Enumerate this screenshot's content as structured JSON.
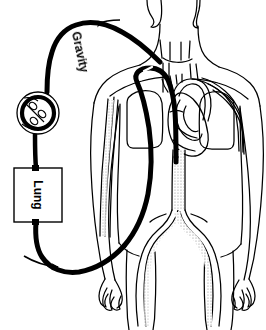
{
  "figure": {
    "domain": "diagram",
    "background_color": "#ffffff",
    "line_color": "#000000",
    "stipple_color": "#9a9a9a",
    "width": 266,
    "height": 330
  },
  "labels": {
    "gravity": "Gravity",
    "lung": "Lung"
  },
  "components": {
    "lung_box": {
      "label": "Lung",
      "x": 14,
      "y": 168,
      "width": 48,
      "height": 54,
      "text_rotation": 90
    },
    "pump": {
      "name": "roller-pump",
      "cx": 38,
      "cy": 113,
      "outer_r": 21,
      "inner_r": 15,
      "roller_count": 3
    },
    "tubing": {
      "color": "#000000",
      "stroke_width": 5,
      "venous_limb_label": "Gravity",
      "arrows": 2
    },
    "cannula": {
      "insertion": "neck / superior vena cava",
      "color": "#000000"
    }
  },
  "arrows": [
    {
      "name": "top-flow-arrow",
      "direction": "left",
      "x": 96,
      "y": 24
    },
    {
      "name": "bottom-flow-arrow",
      "direction": "right",
      "x": 34,
      "y": 262
    }
  ],
  "anatomy": [
    {
      "name": "head-and-neck"
    },
    {
      "name": "torso-outline"
    },
    {
      "name": "left-arm"
    },
    {
      "name": "right-arm"
    },
    {
      "name": "left-lung"
    },
    {
      "name": "right-lung"
    },
    {
      "name": "heart"
    },
    {
      "name": "aortic-arch"
    },
    {
      "name": "descending-aorta"
    },
    {
      "name": "iliac-bifurcation"
    },
    {
      "name": "left-leg"
    },
    {
      "name": "right-leg"
    },
    {
      "name": "subclavian-vessels"
    },
    {
      "name": "arm-vessels"
    }
  ]
}
